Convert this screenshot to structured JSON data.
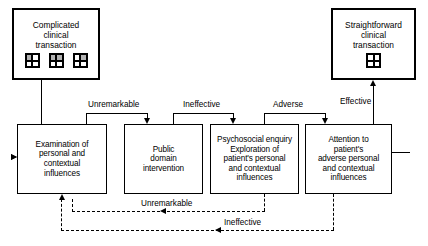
{
  "diagram": {
    "terminals": [
      {
        "id": "complicated",
        "label": "Complicated\nclinical\ntransaction",
        "icons": [
          "grid-2x2-icon",
          "grid-2x2-icon",
          "grid-2x2-icon"
        ],
        "icon_count": 3
      },
      {
        "id": "straightforward",
        "label": "Straightforward\nclinical\ntransaction",
        "icons": [
          "grid-2x2-icon"
        ],
        "icon_count": 1
      }
    ],
    "stages": [
      {
        "id": "stage-1",
        "label": "Examination of\npersonal and\ncontextual\ninfluences"
      },
      {
        "id": "stage-2",
        "label": "Public\ndomain\nintervention"
      },
      {
        "id": "stage-3",
        "label": "Psychosocial enquiry\nExploration of\npatient's personal\nand contextual\ninfluences"
      },
      {
        "id": "stage-4",
        "label": "Attention to\npatient's\nadverse personal\nand contextual\ninfluences"
      }
    ],
    "forward_labels": [
      {
        "id": "label-unremarkable-top",
        "text": "Unremarkable"
      },
      {
        "id": "label-ineffective-top",
        "text": "Ineffective"
      },
      {
        "id": "label-adverse-top",
        "text": "Adverse"
      },
      {
        "id": "label-effective-top",
        "text": "Effective"
      }
    ],
    "feedback_labels": [
      {
        "id": "label-unremarkable-bottom",
        "text": "Unremarkable"
      },
      {
        "id": "label-ineffective-bottom",
        "text": "Ineffective"
      }
    ],
    "colors": {
      "stroke": "#000000",
      "background": "#ffffff",
      "icon_shade": "#b3b3b3"
    }
  }
}
